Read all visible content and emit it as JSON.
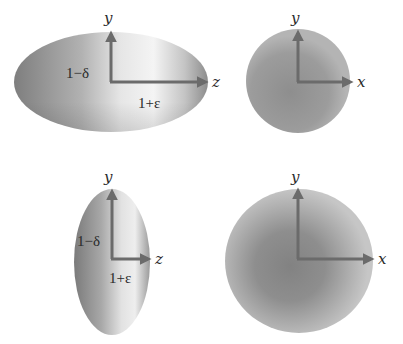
{
  "figure": {
    "panels": [
      {
        "id": "prolate-side",
        "axes": {
          "vertical": "y",
          "horizontal": "z"
        },
        "labels": {
          "minor_axis": "1−δ",
          "major_axis": "1+ε"
        }
      },
      {
        "id": "prolate-end",
        "axes": {
          "vertical": "y",
          "horizontal": "x"
        }
      },
      {
        "id": "oblate-side",
        "axes": {
          "vertical": "y",
          "horizontal": "z"
        },
        "labels": {
          "minor_axis": "1−δ",
          "major_axis": "1+ε"
        }
      },
      {
        "id": "oblate-end",
        "axes": {
          "vertical": "y",
          "horizontal": "x"
        }
      }
    ]
  },
  "colors": {
    "axis": "#6b6b6b",
    "shape_dark": "#858585",
    "shape_mid": "#a0a0a0",
    "shape_light": "#f2f2f2",
    "text": "#2a2a2a"
  }
}
